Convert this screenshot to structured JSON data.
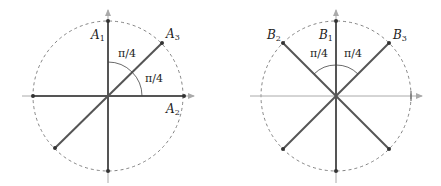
{
  "figure": {
    "left_panel": {
      "labels": {
        "a1": {
          "letter": "A",
          "sub": "1"
        },
        "a2": {
          "letter": "A",
          "sub": "2"
        },
        "a3": {
          "letter": "A",
          "sub": "3"
        }
      },
      "angles": [
        "π/4",
        "π/4"
      ]
    },
    "right_panel": {
      "labels": {
        "b1": {
          "letter": "B",
          "sub": "1"
        },
        "b2": {
          "letter": "B",
          "sub": "2"
        },
        "b3": {
          "letter": "B",
          "sub": "3"
        }
      },
      "angles": [
        "π/4",
        "π/4"
      ]
    },
    "colors": {
      "line": "#555555",
      "axis": "#aaaaaa",
      "circle": "#666666",
      "text": "#222222"
    }
  }
}
